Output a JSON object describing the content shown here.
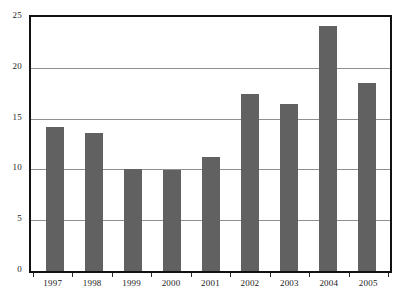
{
  "chart_data": {
    "type": "bar",
    "title": "",
    "subtitle": "",
    "xlabel": "",
    "ylabel": "",
    "categories": [
      "1997",
      "1998",
      "1999",
      "2000",
      "2001",
      "2002",
      "2003",
      "2004",
      "2005"
    ],
    "values": [
      14.2,
      13.6,
      10.0,
      9.9,
      11.2,
      17.4,
      16.4,
      24.1,
      18.5
    ],
    "series": [
      {
        "name": "",
        "values": [
          14.2,
          13.6,
          10.0,
          9.9,
          11.2,
          17.4,
          16.4,
          24.1,
          18.5
        ]
      }
    ],
    "ylim": [
      0,
      25
    ],
    "yticks": [
      0,
      5,
      10,
      15,
      20,
      25
    ],
    "ytick_labels": [
      "0",
      "5",
      "10",
      "15",
      "20",
      "25"
    ],
    "grid": "horizontal",
    "legend": "none",
    "bar_color": "#616161",
    "grid_color": "#8f8f8f",
    "frame_color": "#111111",
    "background_color": "#ffffff",
    "annotations": []
  }
}
